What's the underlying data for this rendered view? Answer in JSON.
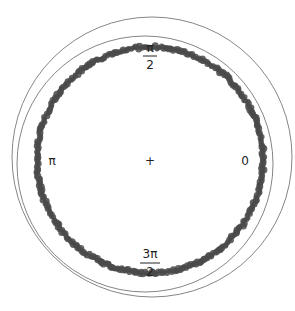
{
  "chart_data": {
    "type": "scatter",
    "title": "",
    "angle_labels": [
      {
        "angle": "0",
        "position": "right"
      },
      {
        "angle": "π/2",
        "numerator": "π",
        "denominator": "2",
        "position": "top"
      },
      {
        "angle": "π",
        "position": "left"
      },
      {
        "angle": "3π/2",
        "numerator": "3π",
        "denominator": "2",
        "position": "bottom"
      }
    ],
    "center_marker": "+",
    "point_color": "#4a4a4a",
    "circle_color": "#777777",
    "ring": {
      "cx": 150,
      "cy": 160,
      "r": 113
    },
    "fitted_circles": [
      {
        "name": "circle-1",
        "cx": 152,
        "cy": 157,
        "r": 140
      },
      {
        "name": "circle-2",
        "cx": 145,
        "cy": 164,
        "r": 128
      }
    ],
    "point_density": "continuous ring of overlapping points, full 0 to 2π coverage"
  },
  "labels": {
    "zero": "0",
    "pi": "π",
    "half_pi_num": "π",
    "half_pi_den": "2",
    "three_half_pi_num": "3π",
    "three_half_pi_den": "2",
    "center": "+"
  }
}
